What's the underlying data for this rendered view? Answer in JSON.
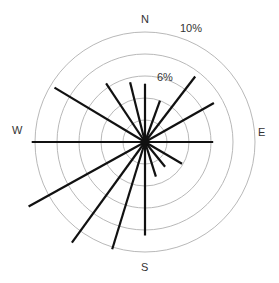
{
  "chart_data": {
    "type": "polar-bar",
    "title": "",
    "subtitle": "",
    "directions": [
      "N",
      "NNE",
      "NE",
      "ENE",
      "E",
      "ESE",
      "SE",
      "SSE",
      "S",
      "SSW",
      "SW",
      "WSW",
      "W",
      "WNW",
      "NW",
      "NNW"
    ],
    "angles_deg": [
      0,
      20,
      37.5,
      60.5,
      90,
      120.5,
      141,
      162.5,
      180,
      197,
      216,
      241,
      270,
      301,
      326.5,
      346
    ],
    "values_percent": [
      5.3,
      4.0,
      7.5,
      7.2,
      6.2,
      3.9,
      2.9,
      3.3,
      8.5,
      10.2,
      11.3,
      12.1,
      10.3,
      9.6,
      6.4,
      5.6
    ],
    "radial_rings_percent": [
      2,
      4,
      6,
      8,
      10
    ],
    "radial_ticklabels": [
      {
        "value": 6,
        "label": "6%"
      },
      {
        "value": 10,
        "label": "10%"
      }
    ],
    "compass_labels": {
      "N": "N",
      "E": "E",
      "S": "S",
      "W": "W"
    },
    "rlim": [
      0,
      10
    ],
    "grid": true,
    "legend": "none"
  },
  "colors": {
    "spoke": "#111111",
    "ring": "#b0b0b0",
    "text": "#333333"
  },
  "labels": {
    "north": "N",
    "east": "E",
    "south": "S",
    "west": "W",
    "ring_6": "6%",
    "ring_10": "10%"
  }
}
